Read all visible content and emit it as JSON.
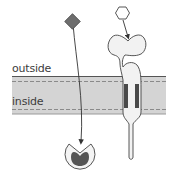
{
  "diagram": {
    "type": "cell-membrane-signaling",
    "labels": {
      "outside": "outside",
      "inside": "inside"
    },
    "elements": [
      {
        "id": "membrane",
        "description": "lipid bilayer band with dashed inner boundaries"
      },
      {
        "id": "lipophilic-ligand",
        "shape": "diamond",
        "color": "#6e6e6e",
        "path": "crosses membrane to intracellular receptor"
      },
      {
        "id": "intracellular-receptor",
        "shape": "notched circle with dark core",
        "location": "inside"
      },
      {
        "id": "hydrophilic-ligand",
        "shape": "hexagon",
        "color": "#ffffff",
        "path": "binds extracellular domain of membrane receptor"
      },
      {
        "id": "membrane-receptor",
        "shape": "transmembrane receptor with extracellular binding pocket",
        "location": "spans membrane"
      }
    ],
    "colors": {
      "stroke": "#3a3a3a",
      "membrane_fill": "#d4d4d4",
      "membrane_dash": "#8a8a8a",
      "ligand_fill": "#6e6e6e",
      "receptor_fill": "#f2f2f2",
      "transmembrane_segment": "#4a4a4a",
      "receptor_core": "#555555"
    }
  }
}
